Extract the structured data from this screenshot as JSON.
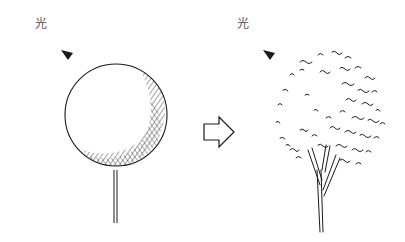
{
  "figure": {
    "left_panel": {
      "light_label": "光",
      "description": "Tree drawn as a simple sphere with hatched shadow on lower-right"
    },
    "arrow": {
      "direction": "right"
    },
    "right_panel": {
      "light_label": "光",
      "description": "Tree drawn with loose leaf strokes, denser on shadowed lower-right, multi-stem trunk"
    },
    "colors": {
      "ink": "#1a1a1a",
      "background": "#ffffff",
      "label": "#555555"
    }
  }
}
